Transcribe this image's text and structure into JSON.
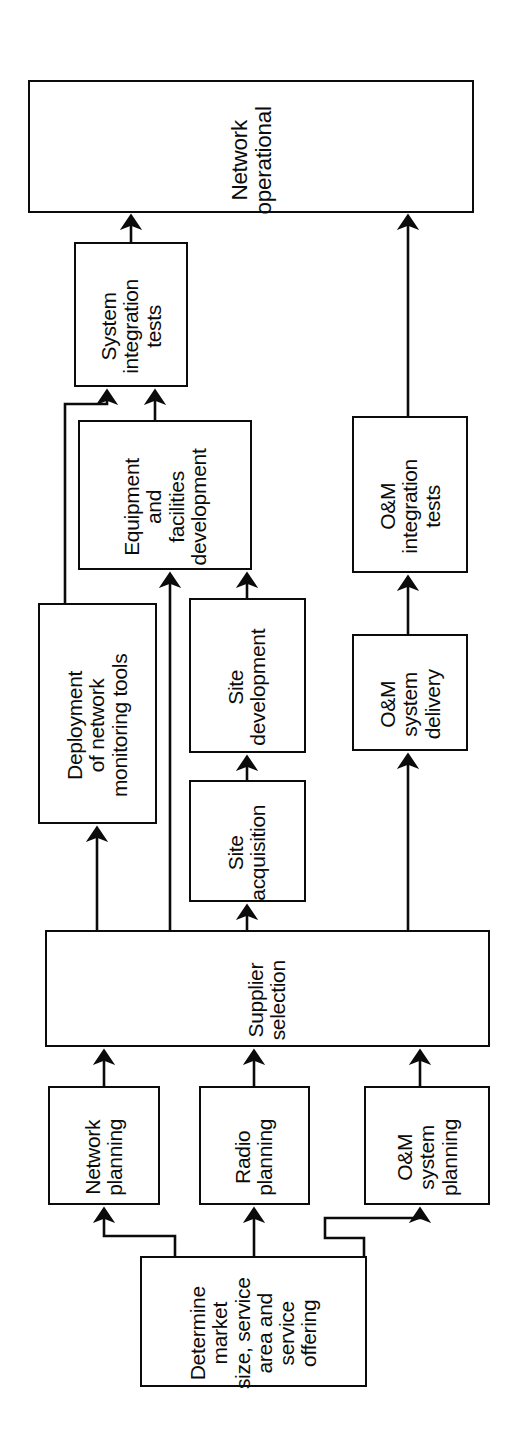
{
  "diagram": {
    "orientation": "rotated-90-ccw",
    "background_color": "#ffffff",
    "line_color": "#0b0b0b",
    "box_fill": "#ffffff",
    "nodes": [
      {
        "id": "network-operational",
        "label": "Network\noperational",
        "x": 28,
        "y": 80,
        "w": 446,
        "h": 133,
        "font": "fs-lg",
        "pad_top": 16
      },
      {
        "id": "system-integration-tests",
        "label": "System\nintegration\ntests",
        "x": 74,
        "y": 242,
        "w": 114,
        "h": 145,
        "font": "fs-md",
        "pad_top": 14
      },
      {
        "id": "equipment-and-facilities-development",
        "label": "Equipment\nand\nfacilities\ndevelopment",
        "x": 78,
        "y": 420,
        "w": 174,
        "h": 150,
        "font": "fs-md",
        "pad_top": 14
      },
      {
        "id": "deployment-of-network-monitoring-tools",
        "label": "Deployment\nof network\nmonitoring tools",
        "x": 38,
        "y": 603,
        "w": 119,
        "h": 221,
        "font": "fs-md",
        "pad_top": 14
      },
      {
        "id": "site-development",
        "label": "Site\ndevelopment",
        "x": 189,
        "y": 598,
        "w": 117,
        "h": 155,
        "font": "fs-md",
        "pad_top": 14
      },
      {
        "id": "site-acquisition",
        "label": "Site\nacquisition",
        "x": 189,
        "y": 780,
        "w": 117,
        "h": 122,
        "font": "fs-md",
        "pad_top": 14
      },
      {
        "id": "om-integration-tests",
        "label": "O&M\nintegration\ntests",
        "x": 352,
        "y": 416,
        "w": 116,
        "h": 157,
        "font": "fs-md",
        "pad_top": 14
      },
      {
        "id": "om-system-delivery",
        "label": "O&M\nsystem\ndelivery",
        "x": 352,
        "y": 634,
        "w": 116,
        "h": 117,
        "font": "fs-md",
        "pad_top": 14
      },
      {
        "id": "supplier-selection",
        "label": "Supplier\nselection",
        "x": 45,
        "y": 930,
        "w": 445,
        "h": 117,
        "font": "fs-md",
        "pad_top": 14
      },
      {
        "id": "network-planning",
        "label": "Network\nplanning",
        "x": 48,
        "y": 1086,
        "w": 112,
        "h": 119,
        "font": "fs-md",
        "pad_top": 14
      },
      {
        "id": "radio-planning",
        "label": "Radio\nplanning",
        "x": 199,
        "y": 1086,
        "w": 111,
        "h": 119,
        "font": "fs-md",
        "pad_top": 14
      },
      {
        "id": "om-system-planning",
        "label": "O&M\nsystem\nplanning",
        "x": 364,
        "y": 1086,
        "w": 126,
        "h": 119,
        "font": "fs-md",
        "pad_top": 14
      },
      {
        "id": "determine-market",
        "label": "Determine\nmarket\nsize, service\narea and\nservice\noffering",
        "x": 140,
        "y": 1256,
        "w": 227,
        "h": 131,
        "font": "fs-md",
        "pad_top": 14
      }
    ],
    "edges": [
      {
        "id": "sit-to-network-operational",
        "from": "system-integration-tests",
        "to": "network-operational",
        "points": "131,242 131,222",
        "arrow": true
      },
      {
        "id": "omit-to-network-operational",
        "from": "om-integration-tests",
        "to": "network-operational",
        "points": "408,416 408,222",
        "arrow": true
      },
      {
        "id": "equipment-to-sit",
        "from": "equipment-and-facilities-development",
        "to": "system-integration-tests",
        "points": "155,420 155,397",
        "arrow": true
      },
      {
        "id": "deployment-to-sit",
        "from": "deployment-of-network-monitoring-tools",
        "to": "system-integration-tests",
        "points": "65,603 65,404 107,404 107,397",
        "arrow": true
      },
      {
        "id": "supplier-to-equipment",
        "from": "supplier-selection",
        "to": "equipment-and-facilities-development",
        "points": "170,930 170,580",
        "arrow": true
      },
      {
        "id": "site-development-to-equipment",
        "from": "site-development",
        "to": "equipment-and-facilities-development",
        "points": "247,598 247,580",
        "arrow": true
      },
      {
        "id": "site-acquisition-to-site-development",
        "from": "site-acquisition",
        "to": "site-development",
        "points": "247,780 247,763",
        "arrow": true
      },
      {
        "id": "supplier-to-site-acquisition",
        "from": "supplier-selection",
        "to": "site-acquisition",
        "points": "247,930 247,912",
        "arrow": true
      },
      {
        "id": "supplier-to-deployment",
        "from": "supplier-selection",
        "to": "deployment-of-network-monitoring-tools",
        "points": "97,930 97,834",
        "arrow": true
      },
      {
        "id": "om-delivery-to-om-tests",
        "from": "om-system-delivery",
        "to": "om-integration-tests",
        "points": "408,634 408,583",
        "arrow": true
      },
      {
        "id": "supplier-to-om-delivery",
        "from": "supplier-selection",
        "to": "om-system-delivery",
        "points": "408,930 408,761",
        "arrow": true
      },
      {
        "id": "network-planning-to-supplier",
        "from": "network-planning",
        "to": "supplier-selection",
        "points": "104,1086 104,1057",
        "arrow": true
      },
      {
        "id": "radio-planning-to-supplier",
        "from": "radio-planning",
        "to": "supplier-selection",
        "points": "254,1086 254,1057",
        "arrow": true
      },
      {
        "id": "om-planning-to-supplier",
        "from": "om-system-planning",
        "to": "supplier-selection",
        "points": "420,1086 420,1057",
        "arrow": true
      },
      {
        "id": "determine-to-network-planning",
        "from": "determine-market",
        "to": "network-planning",
        "points": "175,1256 175,1236 104,1236 104,1215",
        "arrow": true
      },
      {
        "id": "determine-to-radio-planning",
        "from": "determine-market",
        "to": "radio-planning",
        "points": "254,1256 254,1215",
        "arrow": true
      },
      {
        "id": "determine-to-om-planning",
        "from": "determine-market",
        "to": "om-system-planning",
        "points": "364,1256 364,1238 325,1238 325,1218 420,1218 420,1215",
        "arrow": true
      }
    ]
  }
}
